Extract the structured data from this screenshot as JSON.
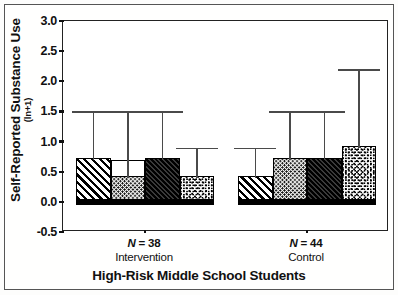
{
  "chart_data": {
    "type": "bar",
    "title": "",
    "xlabel": "High-Risk Middle School Students",
    "ylabel": "Self-Reported Substance Use",
    "ylabel_sub": "(ln+1)",
    "ylim": [
      -0.5,
      3.0
    ],
    "yticks": [
      "3.0",
      "2.5",
      "2.0",
      "1.5",
      "1.0",
      "0.5",
      "0.0",
      "-0.5"
    ],
    "ytick_values": [
      3.0,
      2.5,
      2.0,
      1.5,
      1.0,
      0.5,
      0.0,
      -0.5
    ],
    "grid": false,
    "legend": "none",
    "categories": [
      "Intervention",
      "Control"
    ],
    "group_annotations": [
      {
        "n_label": "N = 38",
        "name": "Intervention"
      },
      {
        "n_label": "N = 44",
        "name": "Control"
      }
    ],
    "series": [
      {
        "name": "bar-1",
        "pattern": "diagonal-hatch",
        "values": [
          0.7,
          0.4
        ],
        "errors_upper": [
          1.5,
          0.9
        ]
      },
      {
        "name": "bar-2",
        "pattern": "fine-stipple",
        "values": [
          0.4,
          0.7
        ],
        "errors_upper": [
          1.5,
          1.5
        ],
        "outline_top": [
          0.7,
          null
        ]
      },
      {
        "name": "bar-3",
        "pattern": "dark-diagonal",
        "values": [
          0.7,
          0.7
        ],
        "errors_upper": [
          1.5,
          1.5
        ]
      },
      {
        "name": "bar-4",
        "pattern": "coarse-stipple",
        "values": [
          0.4,
          0.9
        ],
        "errors_upper": [
          0.9,
          2.2
        ]
      }
    ]
  },
  "colors": {
    "axis": "#111111",
    "bar_edge": "#000000",
    "error_bar": "#4a4a4a",
    "plot_background": "#ffffff",
    "page_background": "#fdfdfc"
  }
}
